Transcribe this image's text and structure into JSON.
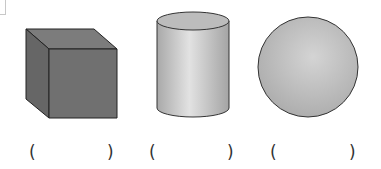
{
  "figure": {
    "shapes": [
      {
        "name": "cube",
        "fill_front": "#6f6f6f",
        "fill_top": "#7e7e7e",
        "fill_side": "#666666"
      },
      {
        "name": "cylinder",
        "fill": "#c6c6c6"
      },
      {
        "name": "sphere",
        "fill": "#bdbdbd"
      }
    ],
    "answers": [
      {
        "open": "(",
        "close": ")",
        "value": ""
      },
      {
        "open": "(",
        "close": ")",
        "value": ""
      },
      {
        "open": "(",
        "close": ")",
        "value": ""
      }
    ]
  }
}
